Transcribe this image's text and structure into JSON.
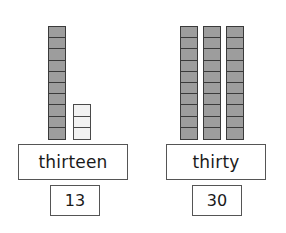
{
  "worksheet": {
    "title": "base-ten blocks number match",
    "background_color": "#ffffff"
  },
  "colors": {
    "cube_filled": "#9d9d9d",
    "cube_empty": "#f2f2f2",
    "cube_border": "#3a3a3a",
    "box_border": "#555555",
    "text": "#1a1a1a"
  },
  "groups": [
    {
      "id": "group-thirteen",
      "word_label": "thirteen",
      "number_label": "13",
      "total": 13,
      "rods": [
        {
          "count": 10,
          "style": "filled"
        },
        {
          "count": 3,
          "style": "empty"
        }
      ]
    },
    {
      "id": "group-thirty",
      "word_label": "thirty",
      "number_label": "30",
      "total": 30,
      "rods": [
        {
          "count": 10,
          "style": "filled"
        },
        {
          "count": 10,
          "style": "filled"
        },
        {
          "count": 10,
          "style": "filled"
        }
      ]
    }
  ]
}
